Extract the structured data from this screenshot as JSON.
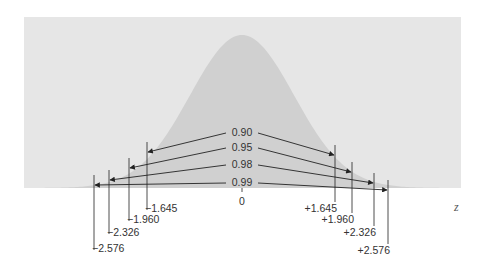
{
  "chart_data": {
    "type": "area",
    "title": "",
    "xlabel": "z",
    "center_label": "0",
    "intervals": [
      {
        "confidence": "0.90",
        "lower": "-1.645",
        "upper": "+1.645",
        "lower_label": "−1.645",
        "upper_label": "+1.645"
      },
      {
        "confidence": "0.95",
        "lower": "-1.960",
        "upper": "+1.960",
        "lower_label": "−1.960",
        "upper_label": "+1.960"
      },
      {
        "confidence": "0.98",
        "lower": "-2.326",
        "upper": "+2.326",
        "lower_label": "−2.326",
        "upper_label": "+2.326"
      },
      {
        "confidence": "0.99",
        "lower": "-2.576",
        "upper": "+2.576",
        "lower_label": "−2.576",
        "upper_label": "+2.576"
      }
    ],
    "colors": {
      "panel": "#e6e6e6",
      "curve_fill": "#d0d0d0",
      "lines": "#222222",
      "text": "#333333"
    }
  },
  "layout": {
    "panel": {
      "x": 24,
      "y": 17,
      "w": 437,
      "h": 171
    },
    "curve": {
      "cx": 242,
      "base_y": 188,
      "peak_y": 35,
      "sigma_px": 52
    },
    "interval_geometry": [
      {
        "left_x": 147,
        "right_x": 335,
        "left_arrow_y": 152,
        "right_arrow_y": 155,
        "label_y": 136,
        "left_text_y": 212,
        "right_text_y": 212
      },
      {
        "left_x": 129,
        "right_x": 352,
        "left_arrow_y": 168,
        "right_arrow_y": 172,
        "label_y": 151,
        "left_text_y": 223,
        "right_text_y": 223
      },
      {
        "left_x": 109,
        "right_x": 374,
        "left_arrow_y": 180,
        "right_arrow_y": 183,
        "label_y": 168,
        "left_text_y": 236,
        "right_text_y": 236
      },
      {
        "left_x": 94,
        "right_x": 388,
        "left_arrow_y": 185,
        "right_arrow_y": 190,
        "label_y": 186,
        "left_text_y": 252,
        "right_text_y": 254
      }
    ]
  }
}
